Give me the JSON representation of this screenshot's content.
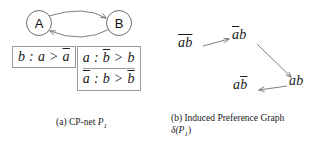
{
  "figure": {
    "panel_a": {
      "caption_prefix": "(a)",
      "caption_text": "CP-net",
      "caption_symbol": "P",
      "caption_subscript": "1",
      "graph": {
        "nodes": [
          {
            "id": "A",
            "label": "A"
          },
          {
            "id": "B",
            "label": "B"
          }
        ],
        "edges": [
          {
            "from": "A",
            "to": "B",
            "style": "curved-arrow"
          },
          {
            "from": "B",
            "to": "A",
            "style": "curved-arrow"
          }
        ]
      },
      "cpt_left": {
        "rows": [
          {
            "condition": "b",
            "preference_better": "a",
            "preference_worse": "a̅",
            "text": "b : a > a̅"
          }
        ]
      },
      "cpt_right": {
        "rows": [
          {
            "condition": "a",
            "preference_better": "b̅",
            "preference_worse": "b",
            "text": "a : b̅ > b"
          },
          {
            "condition": "a̅",
            "preference_better": "b",
            "preference_worse": "b̅",
            "text": "a̅ : b > b̅"
          }
        ]
      }
    },
    "panel_b": {
      "caption_prefix": "(b)",
      "caption_text": "Induced Preference Graph",
      "caption_symbol": "δ(P",
      "caption_subscript": "1",
      "caption_suffix": ")",
      "graph": {
        "nodes": [
          {
            "id": "n0",
            "label": "a̅b̅",
            "display": "ab",
            "bar": "both"
          },
          {
            "id": "n1",
            "label": "a̅b",
            "display": "ab",
            "bar": "a"
          },
          {
            "id": "n2",
            "label": "ab",
            "display": "ab",
            "bar": "none"
          },
          {
            "id": "n3",
            "label": "ab̅",
            "display": "ab",
            "bar": "b"
          }
        ],
        "edges": [
          {
            "from": "n0",
            "to": "n1"
          },
          {
            "from": "n1",
            "to": "n2"
          },
          {
            "from": "n2",
            "to": "n3"
          }
        ]
      }
    }
  },
  "colors": {
    "stroke": "#6f6f6f",
    "box_border": "#9a9a9a",
    "text": "#1a1a1a",
    "background": "#ffffff"
  }
}
